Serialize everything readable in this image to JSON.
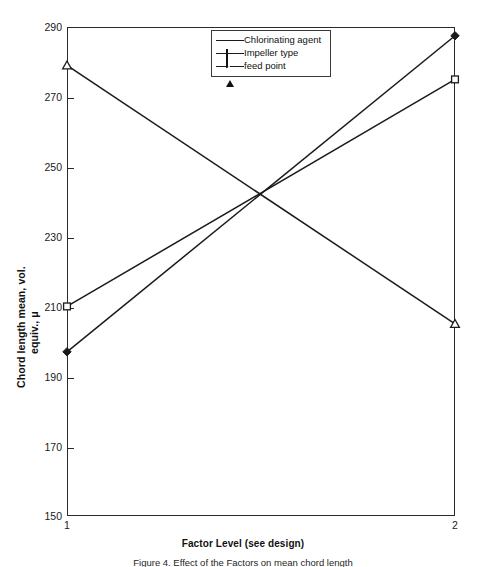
{
  "chart_data": {
    "type": "line",
    "title": "",
    "xlabel": "Factor Level (see design)",
    "ylabel": "Chord length mean, vol. equiv., μ",
    "ylabel_line1": "Chord length mean, vol.",
    "ylabel_line2": "equiv., μ",
    "categories": [
      "1",
      "2"
    ],
    "x": [
      1,
      2
    ],
    "xlim": [
      1,
      2
    ],
    "ylim": [
      150,
      290
    ],
    "yticks": [
      150,
      170,
      190,
      210,
      230,
      250,
      270,
      290
    ],
    "ytick_labels": [
      "150",
      "170",
      "190",
      "210",
      "230",
      "250",
      "270",
      "290"
    ],
    "xtick_labels": [
      "1",
      "2"
    ],
    "grid": false,
    "legend_position": "top-center",
    "series": [
      {
        "name": "Chlorinating agent",
        "marker": "filled-diamond",
        "values": [
          197,
          287.5
        ]
      },
      {
        "name": "Impeller type",
        "marker": "open-square",
        "values": [
          210,
          275
        ]
      },
      {
        "name": "feed point",
        "marker": "open-triangle",
        "values": [
          279,
          205
        ]
      }
    ]
  },
  "legend": {
    "items": [
      {
        "label": "Chlorinating agent",
        "marker": "diamond-marker-icon"
      },
      {
        "label": "Impeller type",
        "marker": "square-marker-icon"
      },
      {
        "label": "feed point",
        "marker": "triangle-marker-icon"
      }
    ]
  },
  "axes": {
    "y_tick_labels": [
      "290",
      "270",
      "250",
      "230",
      "210",
      "190",
      "170",
      "150"
    ],
    "x_tick_labels": [
      "1",
      "2"
    ],
    "x_title": "Factor Level (see design)",
    "y_title_line1": "Chord length mean, vol.",
    "y_title_line2": "equiv., μ"
  },
  "caption": {
    "text": "Figure 4. Effect of the Factors on mean chord length"
  },
  "colors": {
    "line": "#1a1a1a",
    "frame": "#2b2b2b",
    "text": "#111111",
    "background": "#ffffff"
  }
}
